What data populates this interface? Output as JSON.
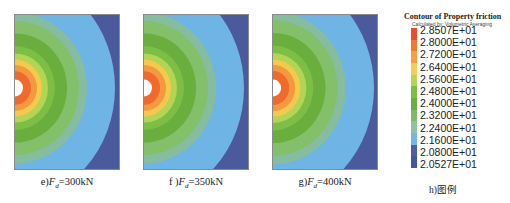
{
  "panels": [
    {
      "id": "e",
      "caption_prefix": "e)",
      "symbol": "F",
      "subscript": "d",
      "caption_value": "=300kN",
      "left": 14,
      "scale": 1.0
    },
    {
      "id": "f",
      "caption_prefix": "f )",
      "symbol": "F",
      "subscript": "d",
      "caption_value": "=350kN",
      "left": 143,
      "scale": 1.0
    },
    {
      "id": "g",
      "caption_prefix": "g)",
      "symbol": "F",
      "subscript": "d",
      "caption_value": "=400kN",
      "left": 272,
      "scale": 1.01
    }
  ],
  "legend": {
    "title": "Contour of Property friction",
    "subtitle": "Calculated by: Volumetric Averaging",
    "values": [
      "2.8507E+01",
      "2.8000E+01",
      "2.7200E+01",
      "2.6400E+01",
      "2.5600E+01",
      "2.4800E+01",
      "2.4000E+01",
      "2.3200E+01",
      "2.2400E+01",
      "2.1600E+01",
      "2.0800E+01",
      "2.0527E+01"
    ],
    "colors": [
      "#e8502a",
      "#f07a30",
      "#f5a043",
      "#f3cf55",
      "#b8d454",
      "#7cbf45",
      "#68b040",
      "#82b86a",
      "#8fc3a3",
      "#73b8e0",
      "#4e5ea0",
      "#46569a"
    ],
    "caption": "h)图例"
  },
  "contour_bands": [
    {
      "color": "#4a5a9c",
      "r": 170
    },
    {
      "color": "#6eb4e4",
      "r": 100
    },
    {
      "color": "#86bda0",
      "r": 72
    },
    {
      "color": "#84bf6a",
      "r": 64
    },
    {
      "color": "#6aae3e",
      "r": 52
    },
    {
      "color": "#7dbe45",
      "r": 40
    },
    {
      "color": "#b4d456",
      "r": 33
    },
    {
      "color": "#f5c94e",
      "r": 27
    },
    {
      "color": "#f39a40",
      "r": 22
    },
    {
      "color": "#ef6a2c",
      "r": 16
    },
    {
      "color": "#ffffff",
      "r": 8
    }
  ]
}
